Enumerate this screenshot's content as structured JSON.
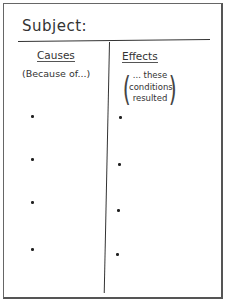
{
  "organizer": {
    "title": "Subject:",
    "columns": [
      {
        "heading": "Causes",
        "prompt": "(Because of...)",
        "bullet_count": 4
      },
      {
        "heading": "Effects",
        "prompt_lines": [
          "... these",
          "conditions",
          "resulted"
        ],
        "bullet_count": 4
      }
    ],
    "open_paren": "(",
    "close_paren": ")",
    "bullet_glyph": "•"
  }
}
